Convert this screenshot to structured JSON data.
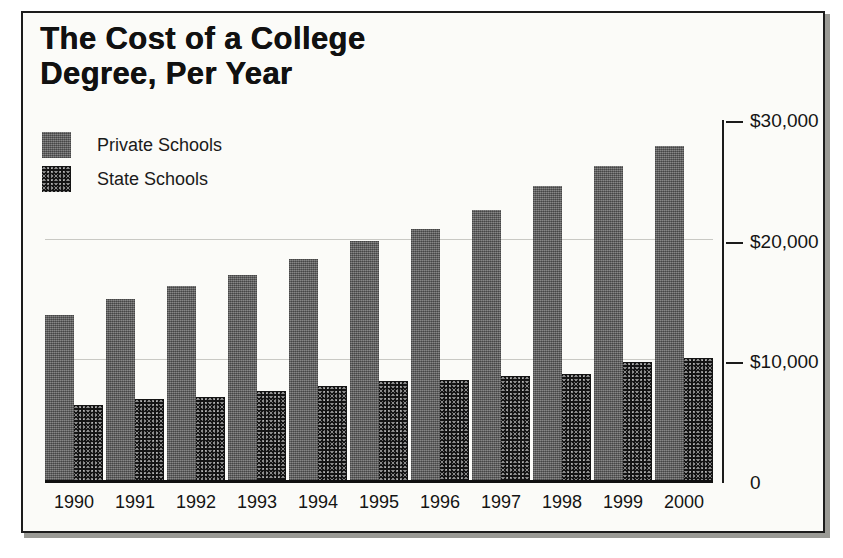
{
  "frame": {
    "border_color": "#1c1c1c",
    "page_color": "#fbfbf8"
  },
  "title": "The Cost of a College\nDegree, Per Year",
  "legend": {
    "position": "top-left",
    "items": [
      {
        "label": "Private Schools",
        "swatch": "private-swatch",
        "color": "#6e6e6e"
      },
      {
        "label": "State Schools",
        "swatch": "state-swatch",
        "color": "#141414"
      }
    ]
  },
  "axis": {
    "y_position": "right",
    "y_ticks": [
      {
        "label": "$30,000",
        "value": 30000
      },
      {
        "label": "$20,000",
        "value": 20000
      },
      {
        "label": "$10,000",
        "value": 10000
      },
      {
        "label": "0",
        "value": 0
      }
    ],
    "gridlines": [
      20000,
      10000,
      30000
    ]
  },
  "chart_data": {
    "type": "bar",
    "title": "The Cost of a College Degree, Per Year",
    "xlabel": "",
    "ylabel": "",
    "ylim": [
      0,
      30000
    ],
    "grid": true,
    "legend_position": "top-left",
    "y_axis_side": "right",
    "y_tick_labels": [
      "0",
      "$10,000",
      "$20,000",
      "$30,000"
    ],
    "categories": [
      "1990",
      "1991",
      "1992",
      "1993",
      "1994",
      "1995",
      "1996",
      "1997",
      "1998",
      "1999",
      "2000"
    ],
    "series": [
      {
        "name": "Private Schools",
        "color": "#6e6e6e",
        "values": [
          13700,
          15000,
          16100,
          17000,
          18300,
          19800,
          20800,
          22400,
          24400,
          26000,
          27700
        ]
      },
      {
        "name": "State Schools",
        "color": "#141414",
        "values": [
          6200,
          6700,
          6900,
          7400,
          7800,
          8200,
          8300,
          8600,
          8800,
          9800,
          10100
        ]
      }
    ]
  }
}
